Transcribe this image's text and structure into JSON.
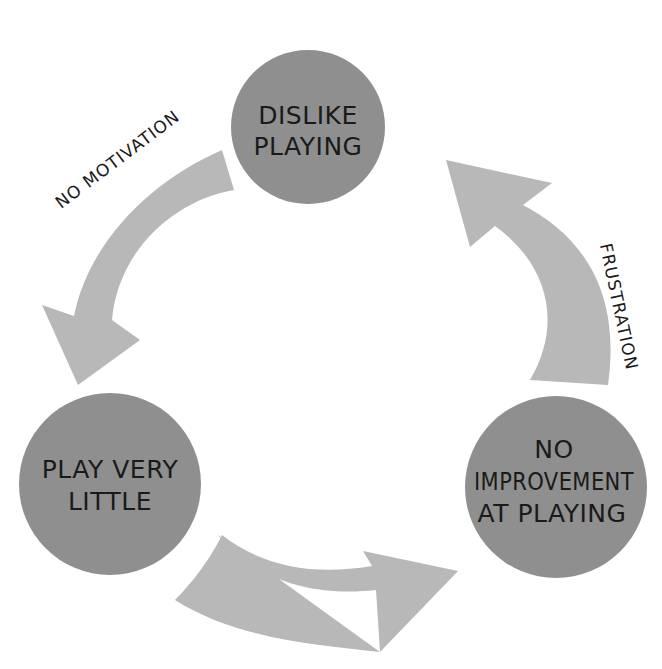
{
  "diagram": {
    "type": "cycle",
    "colors": {
      "node_fill": "#8f8f8f",
      "arrow_fill": "#b8b8b8",
      "text": "#1a1a1a",
      "background": "#ffffff"
    },
    "nodes": [
      {
        "id": "dislike",
        "lines": [
          "DISLIKE",
          "PLAYING"
        ]
      },
      {
        "id": "play-little",
        "lines": [
          "PLAY VERY",
          "LITTLE"
        ]
      },
      {
        "id": "no-improvement",
        "lines": [
          "NO",
          "IMPROVEMENT",
          "AT PLAYING"
        ]
      }
    ],
    "edges": [
      {
        "from": "dislike",
        "to": "play-little",
        "label": "NO MOTIVATION"
      },
      {
        "from": "play-little",
        "to": "no-improvement",
        "label": ""
      },
      {
        "from": "no-improvement",
        "to": "dislike",
        "label": "FRUSTRATION"
      }
    ]
  }
}
